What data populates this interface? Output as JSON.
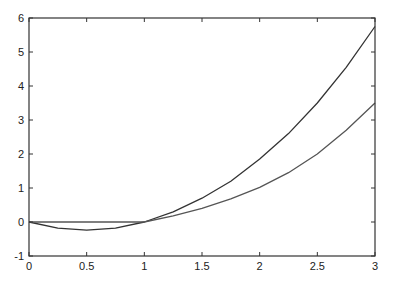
{
  "chart_data": {
    "type": "line",
    "title": "",
    "xlabel": "",
    "ylabel": "",
    "xlim": [
      0,
      3
    ],
    "ylim": [
      -1,
      6
    ],
    "grid": false,
    "legend": null,
    "x_ticks": [
      "0",
      "0.5",
      "1",
      "1.5",
      "2",
      "2.5",
      "3"
    ],
    "y_ticks": [
      "-1",
      "0",
      "1",
      "2",
      "3",
      "4",
      "5",
      "6"
    ],
    "x": [
      0,
      0.25,
      0.5,
      0.75,
      1.0,
      1.25,
      1.5,
      1.75,
      2.0,
      2.25,
      2.5,
      2.75,
      3.0
    ],
    "series": [
      {
        "name": "curve-1",
        "color": "#333333",
        "values": [
          0,
          -0.18,
          -0.24,
          -0.18,
          0,
          0.3,
          0.7,
          1.2,
          1.85,
          2.6,
          3.5,
          4.55,
          5.75
        ]
      },
      {
        "name": "curve-2",
        "color": "#555555",
        "values": [
          0,
          0,
          0,
          0,
          0,
          0.18,
          0.4,
          0.68,
          1.02,
          1.45,
          2.0,
          2.7,
          3.5
        ]
      }
    ]
  }
}
